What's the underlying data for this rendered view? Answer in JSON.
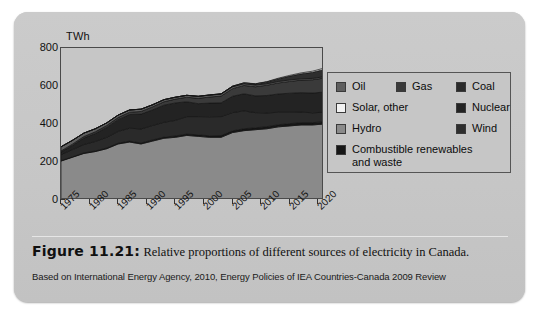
{
  "figure": {
    "number_label": "Figure 11.21",
    "caption_separator": ":",
    "caption_text": "Relative proportions of different sources of electricity in Canada.",
    "source_line": "Based on International Energy Agency, 2010, Energy Policies of IEA Countries-Canada 2009 Review"
  },
  "legend": {
    "items": [
      {
        "label": "Oil",
        "color": "#5e5e5e"
      },
      {
        "label": "Gas",
        "color": "#3a3a3a"
      },
      {
        "label": "Coal",
        "color": "#2a2a2a"
      },
      {
        "label": "Solar, other",
        "color": "#f2f2f2"
      },
      {
        "label": "Nuclear",
        "color": "#232323"
      },
      {
        "label": "Hydro",
        "color": "#8a8a8a"
      },
      {
        "label": "Wind",
        "color": "#2e2e2e"
      },
      {
        "label": "Combustible renewables and waste",
        "color": "#171717"
      }
    ]
  },
  "chart_data": {
    "type": "area",
    "stacked": true,
    "title": "",
    "xlabel": "",
    "ylabel": "TWh",
    "ylim": [
      0,
      800
    ],
    "yticks": [
      0,
      200,
      400,
      600,
      800
    ],
    "ytick_labels": [
      "0",
      "200",
      "400",
      "600",
      "800"
    ],
    "xlim": [
      1975,
      2021
    ],
    "xticks": [
      1975,
      1980,
      1985,
      1990,
      1995,
      2000,
      2005,
      2010,
      2015,
      2020
    ],
    "xtick_labels": [
      "1975",
      "1980",
      "1985",
      "1990",
      "1995",
      "2000",
      "2005",
      "2010",
      "2015",
      "2020"
    ],
    "grid": false,
    "legend_position": "right",
    "x": [
      1975,
      1977,
      1979,
      1981,
      1983,
      1985,
      1987,
      1989,
      1991,
      1993,
      1995,
      1997,
      1999,
      2001,
      2003,
      2005,
      2007,
      2009,
      2011,
      2013,
      2015,
      2017,
      2019,
      2021
    ],
    "series": [
      {
        "name": "Hydro",
        "color": "#8a8a8a",
        "values": [
          205,
          225,
          245,
          255,
          270,
          295,
          305,
          295,
          310,
          325,
          330,
          340,
          335,
          330,
          330,
          355,
          365,
          370,
          375,
          385,
          390,
          395,
          395,
          400
        ]
      },
      {
        "name": "Combustible renewables and waste",
        "color": "#171717",
        "values": [
          2,
          2,
          3,
          3,
          4,
          4,
          5,
          5,
          6,
          6,
          7,
          7,
          8,
          8,
          9,
          9,
          10,
          10,
          11,
          11,
          12,
          12,
          12,
          12
        ]
      },
      {
        "name": "Coal",
        "color": "#2a2a2a",
        "values": [
          32,
          38,
          44,
          50,
          56,
          62,
          68,
          74,
          76,
          78,
          82,
          92,
          96,
          100,
          100,
          96,
          94,
          80,
          72,
          66,
          60,
          56,
          52,
          50
        ]
      },
      {
        "name": "Nuclear",
        "color": "#232323",
        "values": [
          13,
          22,
          34,
          42,
          52,
          62,
          72,
          78,
          82,
          90,
          92,
          78,
          68,
          72,
          72,
          86,
          90,
          88,
          92,
          96,
          100,
          102,
          104,
          106
        ]
      },
      {
        "name": "Gas",
        "color": "#3a3a3a",
        "values": [
          6,
          7,
          8,
          9,
          10,
          11,
          12,
          14,
          16,
          18,
          20,
          24,
          28,
          32,
          36,
          40,
          44,
          48,
          54,
          58,
          62,
          66,
          70,
          74
        ],
        "note": "thin dark band near top of stack"
      },
      {
        "name": "Oil",
        "color": "#5e5e5e",
        "values": [
          22,
          20,
          18,
          16,
          14,
          13,
          12,
          12,
          11,
          11,
          10,
          10,
          10,
          10,
          10,
          10,
          9,
          9,
          8,
          8,
          8,
          7,
          7,
          7
        ]
      },
      {
        "name": "Wind",
        "color": "#2e2e2e",
        "values": [
          0,
          0,
          0,
          0,
          0,
          0,
          0,
          0,
          0,
          0,
          0,
          0,
          1,
          1,
          2,
          3,
          4,
          6,
          9,
          14,
          20,
          26,
          32,
          38
        ]
      },
      {
        "name": "Solar, other",
        "color": "#f2f2f2",
        "values": [
          0,
          0,
          0,
          0,
          0,
          0,
          0,
          0,
          0,
          0,
          0,
          0,
          0,
          0,
          0,
          0,
          1,
          1,
          2,
          3,
          4,
          5,
          6,
          7
        ]
      }
    ],
    "totals": [
      280,
      314,
      352,
      375,
      406,
      447,
      474,
      478,
      501,
      528,
      541,
      551,
      546,
      553,
      559,
      599,
      617,
      612,
      623,
      641,
      656,
      669,
      678,
      694
    ]
  }
}
